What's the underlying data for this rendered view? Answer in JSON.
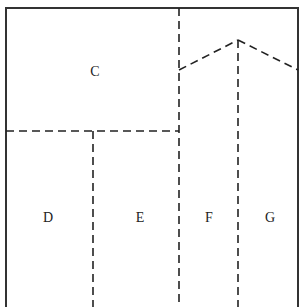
{
  "diagram": {
    "title": "",
    "colors": {
      "background": "#ffffff",
      "border": "#333333",
      "dashed": "#222222",
      "text": "#222222"
    },
    "regions": [
      {
        "id": "C",
        "label": "C",
        "x": 95,
        "y": 76
      },
      {
        "id": "D",
        "label": "D",
        "x": 48,
        "y": 222
      },
      {
        "id": "E",
        "label": "E",
        "x": 140,
        "y": 222
      },
      {
        "id": "F",
        "label": "F",
        "x": 209,
        "y": 222
      },
      {
        "id": "G",
        "label": "G",
        "x": 270,
        "y": 222
      }
    ],
    "frame": {
      "left": 6,
      "top": 8,
      "right": 298,
      "bottom": 307
    },
    "dashed_lines": [
      {
        "name": "vertical-divider-center",
        "x1": 179,
        "y1": 8,
        "x2": 179,
        "y2": 307
      },
      {
        "name": "horizontal-divider-c",
        "x1": 6,
        "y1": 131,
        "x2": 179,
        "y2": 131
      },
      {
        "name": "vertical-divider-de",
        "x1": 93,
        "y1": 131,
        "x2": 93,
        "y2": 307
      },
      {
        "name": "roof-left-slope",
        "x1": 179,
        "y1": 70,
        "x2": 238,
        "y2": 40
      },
      {
        "name": "roof-right-slope",
        "x1": 238,
        "y1": 40,
        "x2": 298,
        "y2": 70
      },
      {
        "name": "vertical-divider-fg",
        "x1": 238,
        "y1": 40,
        "x2": 238,
        "y2": 307
      }
    ]
  }
}
